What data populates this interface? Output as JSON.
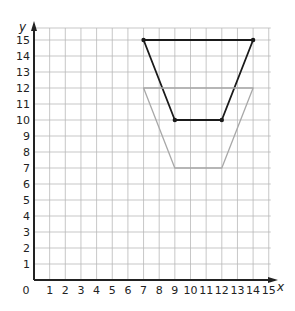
{
  "chart_data": {
    "type": "line",
    "title": "",
    "xlabel": "x",
    "ylabel": "y",
    "xlim": [
      0,
      15
    ],
    "ylim": [
      0,
      15
    ],
    "grid": true,
    "x_ticks": [
      "0",
      "1",
      "2",
      "3",
      "4",
      "5",
      "6",
      "7",
      "8",
      "9",
      "10",
      "11",
      "12",
      "13",
      "14",
      "15"
    ],
    "y_ticks": [
      "1",
      "2",
      "3",
      "4",
      "5",
      "6",
      "7",
      "8",
      "9",
      "10",
      "11",
      "12",
      "13",
      "14",
      "15"
    ],
    "series": [
      {
        "name": "original-trapezoid",
        "color": "#1a1a1a",
        "closed": true,
        "show_vertices": true,
        "points": [
          [
            7,
            15
          ],
          [
            14,
            15
          ],
          [
            12,
            10
          ],
          [
            9,
            10
          ]
        ]
      },
      {
        "name": "translated-trapezoid",
        "color": "#a8a8a8",
        "closed": true,
        "show_vertices": false,
        "points": [
          [
            7,
            12
          ],
          [
            14,
            12
          ],
          [
            12,
            7
          ],
          [
            9,
            7
          ]
        ]
      }
    ]
  },
  "colors": {
    "grid": "#b9b9b9",
    "axis": "#222222",
    "background": "#ffffff"
  }
}
